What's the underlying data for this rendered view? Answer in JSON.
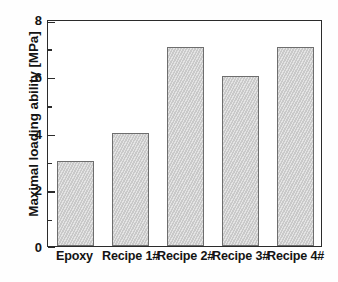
{
  "chart_data": {
    "type": "bar",
    "title": "",
    "subtitle": "",
    "xlabel": "",
    "ylabel": "Maximal loading ability [MPa]",
    "categories": [
      "Epoxy",
      "Recipe 1#",
      "Recipe 2#",
      "Recipe 3#",
      "Recipe 4#"
    ],
    "values": [
      3,
      4,
      7,
      6,
      7
    ],
    "series": [
      {
        "name": "Maximal loading ability",
        "values": [
          3,
          4,
          7,
          6,
          7
        ]
      }
    ],
    "ylim": [
      0,
      8
    ],
    "y_major_ticks": [
      0,
      2,
      4,
      6,
      8
    ],
    "y_major_tick_labels": [
      "0",
      "2",
      "4",
      "6",
      "8"
    ],
    "y_minor_ticks": [
      1,
      3,
      5,
      7
    ],
    "grid": false,
    "legend": false,
    "legend_position": "none",
    "units": "MPa",
    "colors": {
      "bar_fill": "#d2d2d2",
      "bar_edge": "#6e6e6e",
      "axis": "#2b2b2b",
      "text": "#141414",
      "background": "#ffffff"
    }
  },
  "axes": {
    "y_title": "Maximal loading ability [MPa]",
    "y_tick_labels": [
      "8",
      "6",
      "4",
      "2",
      "0"
    ],
    "x_tick_labels": [
      "Epoxy",
      "Recipe 1#",
      "Recipe 2#",
      "Recipe 3#",
      "Recipe 4#"
    ]
  }
}
